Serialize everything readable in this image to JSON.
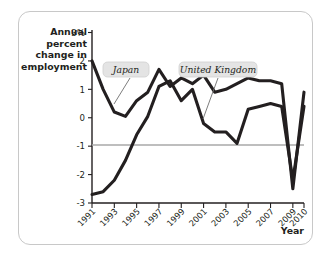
{
  "figure": {
    "year_axis_label": "Year",
    "y_axis_title_lines": [
      "Annual",
      "percent",
      "change in",
      "employment"
    ]
  },
  "chart_data": {
    "type": "line",
    "title": "",
    "xlabel": "Year",
    "ylabel": "Annual percent change in employment",
    "x": [
      1991,
      1992,
      1993,
      1994,
      1995,
      1996,
      1997,
      1998,
      1999,
      2000,
      2001,
      2002,
      2003,
      2004,
      2005,
      2006,
      2007,
      2008,
      2009,
      2010
    ],
    "xlim": [
      1991,
      2010
    ],
    "ylim": [
      -3,
      3
    ],
    "ytick_labels": [
      "3%",
      "2",
      "1",
      "0",
      "-1",
      "-2",
      "-3"
    ],
    "ytick_values": [
      3,
      2,
      1,
      0,
      -1,
      -2,
      -3
    ],
    "xtick_values": [
      1991,
      1993,
      1995,
      1997,
      1999,
      2001,
      2003,
      2005,
      2007,
      2009,
      2010
    ],
    "xtick_labels": [
      "1991",
      "1993",
      "1995",
      "1997",
      "1999",
      "2001",
      "2003",
      "2005",
      "2007",
      "2009",
      "2010"
    ],
    "grid": false,
    "zero_line": true,
    "legend_position": "inline-callouts",
    "series": [
      {
        "name": "Japan",
        "values": [
          -2.7,
          -2.6,
          -2.2,
          -1.5,
          -0.6,
          0.05,
          1.1,
          1.3,
          0.6,
          1.0,
          -0.2,
          -0.5,
          -0.5,
          -0.9,
          0.3,
          0.4,
          0.5,
          0.4,
          -2.2,
          0.4
        ]
      },
      {
        "name": "United Kingdom",
        "values": [
          2.0,
          1.0,
          0.2,
          0.05,
          0.6,
          0.9,
          1.7,
          1.1,
          1.4,
          1.2,
          1.5,
          0.9,
          1.0,
          1.2,
          1.4,
          1.3,
          1.3,
          1.2,
          -2.5,
          0.9
        ]
      }
    ],
    "annotations": [
      {
        "label": "Japan",
        "points_to_year": 1994
      },
      {
        "label": "United Kingdom",
        "points_to_year": 2002
      }
    ]
  }
}
